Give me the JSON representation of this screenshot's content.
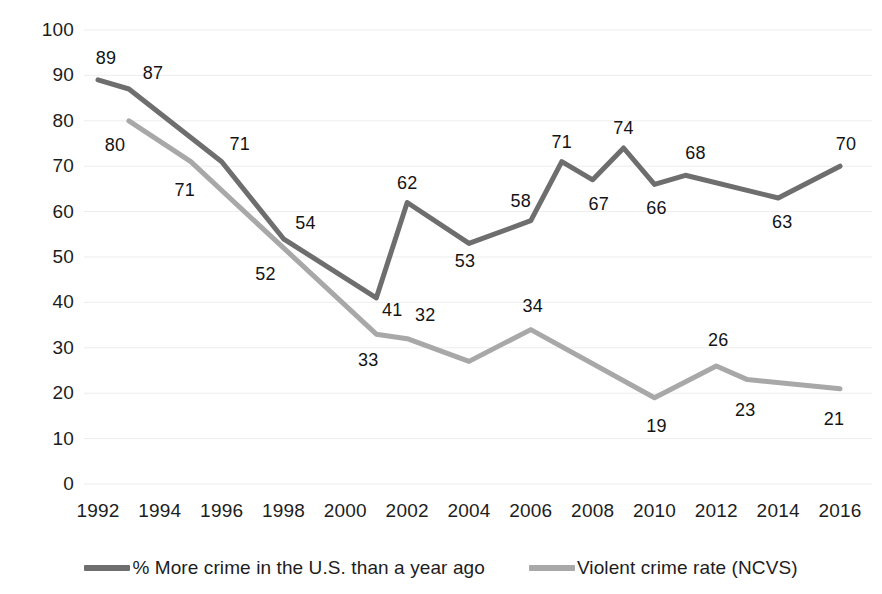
{
  "chart_data": {
    "type": "line",
    "title": "",
    "subtitle": "",
    "xlabel": "",
    "ylabel": "",
    "xlim": [
      1992,
      2016
    ],
    "ylim": [
      0,
      100
    ],
    "grid": true,
    "legend_position": "bottom",
    "y_ticks": [
      "100",
      "90",
      "80",
      "70",
      "60",
      "50",
      "40",
      "30",
      "20",
      "10",
      "0"
    ],
    "y_tick_values": [
      100,
      90,
      80,
      70,
      60,
      50,
      40,
      30,
      20,
      10,
      0
    ],
    "x_ticks": [
      "1992",
      "1994",
      "1996",
      "1998",
      "2000",
      "2002",
      "2004",
      "2006",
      "2008",
      "2010",
      "2012",
      "2014",
      "2016"
    ],
    "x_tick_values": [
      1992,
      1994,
      1996,
      1998,
      2000,
      2002,
      2004,
      2006,
      2008,
      2010,
      2012,
      2014,
      2016
    ],
    "series": [
      {
        "name": "% More crime in the U.S. than a year ago",
        "color": "#6e6e6e",
        "x": [
          1992,
          1993,
          1996,
          1998,
          2001,
          2002,
          2004,
          2006,
          2007,
          2008,
          2009,
          2010,
          2011,
          2014,
          2016
        ],
        "values": [
          89,
          87,
          71,
          54,
          41,
          62,
          53,
          58,
          71,
          67,
          74,
          66,
          68,
          63,
          70
        ],
        "labels": [
          "89",
          "87",
          "71",
          "54",
          "41",
          "62",
          "53",
          "58",
          "71",
          "67",
          "74",
          "66",
          "68",
          "63",
          "70"
        ],
        "label_positions": [
          "above",
          "above",
          "above",
          "above",
          "below",
          "above",
          "below",
          "above",
          "above",
          "below",
          "above",
          "below",
          "above",
          "below",
          "above"
        ]
      },
      {
        "name": "Violent crime rate (NCVS)",
        "color": "#a8a8a8",
        "x": [
          1993,
          1995,
          1998,
          2001,
          2002,
          2004,
          2006,
          2010,
          2012,
          2013,
          2016
        ],
        "values": [
          80,
          71,
          52,
          33,
          32,
          27,
          34,
          19,
          26,
          23,
          21
        ],
        "labels": [
          "80",
          "71",
          "52",
          "33",
          "32",
          "",
          "34",
          "19",
          "26",
          "23",
          "21"
        ],
        "label_positions": [
          "below",
          "below",
          "below",
          "below",
          "above",
          "none",
          "above",
          "below",
          "above",
          "below",
          "below"
        ]
      }
    ]
  },
  "legend": {
    "items": [
      {
        "label": "% More crime in the U.S. than a year ago",
        "color": "#6e6e6e",
        "swatch_name": "legend-swatch-more-crime"
      },
      {
        "label": "Violent crime rate (NCVS)",
        "color": "#a8a8a8",
        "swatch_name": "legend-swatch-violent-crime-rate"
      }
    ]
  }
}
